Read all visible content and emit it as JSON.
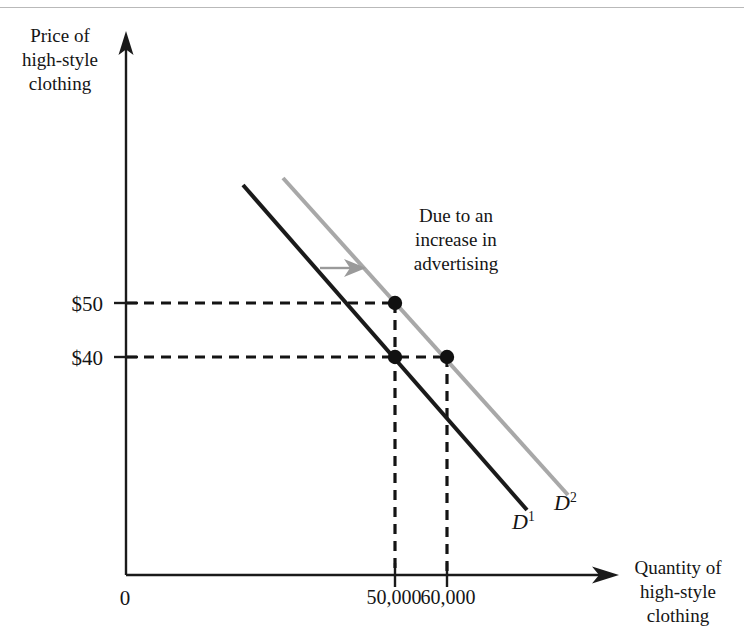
{
  "figure": {
    "y_axis_title": "Price of\nhigh-style\nclothing",
    "x_axis_title": "Quantity of\nhigh-style\nclothing",
    "annotation": "Due to an\nincrease in\nadvertising",
    "origin_label": "0",
    "curve_label_1_base": "D",
    "curve_label_1_sup": "1",
    "curve_label_2_base": "D",
    "curve_label_2_sup": "2",
    "colors": {
      "axis": "#1a1a1a",
      "curve_initial": "#1a1a1a",
      "curve_shifted": "#a8a8a8",
      "shift_arrow": "#9a9a9a",
      "guide_dash": "#141414",
      "point": "#111111",
      "background": "#ffffff",
      "scan_line": "#b9b9b9"
    }
  },
  "chart_data": {
    "type": "line",
    "title": "",
    "xlabel": "Quantity of high-style clothing",
    "ylabel": "Price of high-style clothing",
    "grid": false,
    "legend": "inline-curve-labels",
    "xlim": [
      0,
      85000
    ],
    "ylim": [
      0,
      90
    ],
    "y_tick_labels": [
      "$50",
      "$40"
    ],
    "y_tick_values": [
      50,
      40
    ],
    "x_tick_labels": [
      "50,000",
      "60,000"
    ],
    "x_tick_values": [
      50000,
      60000
    ],
    "origin_tick_label": "0",
    "series": [
      {
        "name": "D1",
        "label": "D¹",
        "color": "#1a1a1a",
        "style": "solid",
        "endpoints_px": [
          [
            243,
            185
          ],
          [
            527,
            510
          ]
        ],
        "description": "Initial demand curve"
      },
      {
        "name": "D2",
        "label": "D²",
        "color": "#a8a8a8",
        "style": "solid",
        "endpoints_px": [
          [
            283,
            178
          ],
          [
            568,
            495
          ]
        ],
        "description": "Demand curve after increase in advertising"
      }
    ],
    "points": [
      {
        "name": "p50-on-D2",
        "price": 50,
        "quantity": 50000,
        "curve": "D2",
        "px": [
          395,
          303
        ]
      },
      {
        "name": "p40-on-D1",
        "price": 40,
        "quantity": 50000,
        "curve": "D1",
        "px": [
          395,
          357
        ]
      },
      {
        "name": "p40-on-D2",
        "price": 40,
        "quantity": 60000,
        "curve": "D2",
        "px": [
          447,
          357
        ]
      }
    ],
    "annotations": [
      {
        "text": "Due to an increase in advertising",
        "kind": "shift-note"
      },
      {
        "text": "rightward shift arrow",
        "kind": "arrow",
        "px": [
          [
            322,
            268
          ],
          [
            362,
            268
          ]
        ]
      }
    ]
  }
}
